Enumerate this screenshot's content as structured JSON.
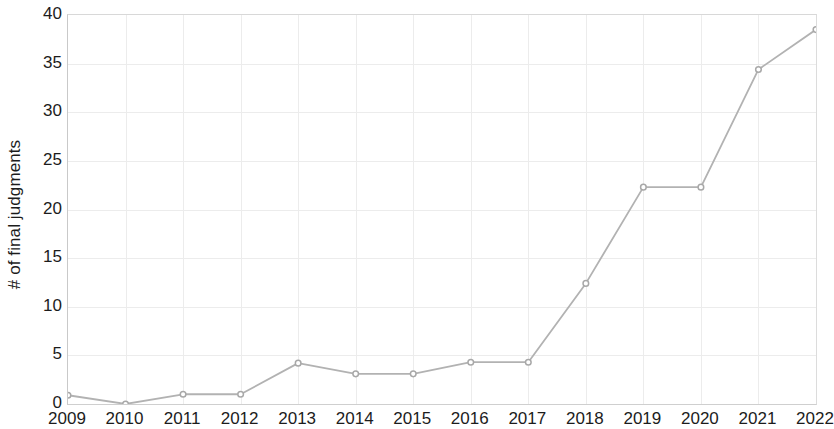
{
  "chart_data": {
    "type": "line",
    "title": "",
    "xlabel": "",
    "ylabel": "# of final judgments",
    "x": [
      2009,
      2010,
      2011,
      2012,
      2013,
      2014,
      2015,
      2016,
      2017,
      2018,
      2019,
      2020,
      2021,
      2022
    ],
    "categories": [
      "2009",
      "2010",
      "2011",
      "2012",
      "2013",
      "2014",
      "2015",
      "2016",
      "2017",
      "2018",
      "2019",
      "2020",
      "2021",
      "2022"
    ],
    "values": [
      0.9,
      0.0,
      1.0,
      1.0,
      4.2,
      3.1,
      3.1,
      4.3,
      4.3,
      12.4,
      22.3,
      22.3,
      34.4,
      38.5
    ],
    "series": [
      {
        "name": "# of final judgments",
        "values": [
          0.9,
          0.0,
          1.0,
          1.0,
          4.2,
          3.1,
          3.1,
          4.3,
          4.3,
          12.4,
          22.3,
          22.3,
          34.4,
          38.5
        ]
      }
    ],
    "xlim": [
      2009,
      2022
    ],
    "ylim": [
      0,
      40
    ],
    "yticks": [
      0,
      5,
      10,
      15,
      20,
      25,
      30,
      35,
      40
    ],
    "ytick_labels": [
      "0",
      "5",
      "10",
      "15",
      "20",
      "25",
      "30",
      "35",
      "40"
    ],
    "xticks": [
      2009,
      2010,
      2011,
      2012,
      2013,
      2014,
      2015,
      2016,
      2017,
      2018,
      2019,
      2020,
      2021,
      2022
    ],
    "xtick_labels": [
      "2009",
      "2010",
      "2011",
      "2012",
      "2013",
      "2014",
      "2015",
      "2016",
      "2017",
      "2018",
      "2019",
      "2020",
      "2021",
      "2022"
    ],
    "grid": true,
    "legend": false,
    "legend_position": "none",
    "colors": {
      "line": "#b2b2b2",
      "marker_fill": "#ffffff",
      "marker_stroke": "#a8a8a8",
      "grid": "#ececec",
      "axis": "#c9c9c9",
      "text": "#1c1c1c",
      "background": "#ffffff"
    },
    "marker": "circle"
  }
}
